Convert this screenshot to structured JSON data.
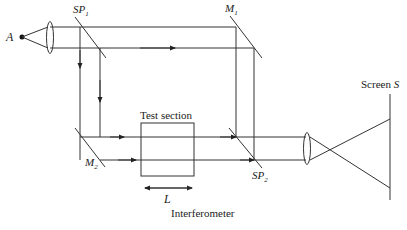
{
  "diagram": {
    "caption": "Interferometer",
    "labels": {
      "source": "A",
      "splitter1": "SP",
      "splitter1_sub": "1",
      "mirror1": "M",
      "mirror1_sub": "1",
      "mirror2": "M",
      "mirror2_sub": "2",
      "splitter2": "SP",
      "splitter2_sub": "2",
      "test_section": "Test section",
      "length": "L",
      "screen": "Screen",
      "screen_symbol": "S"
    },
    "colors": {
      "line": "#333333",
      "text": "#222222",
      "background": "#ffffff"
    }
  }
}
